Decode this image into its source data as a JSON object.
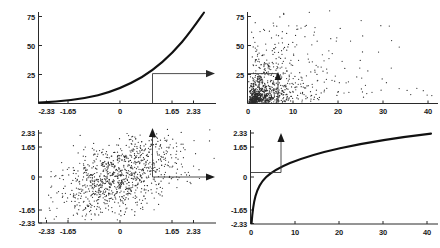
{
  "figure": {
    "title": "",
    "background_color": "#ffffff",
    "ink_color": "#111111",
    "panel_count": 4
  },
  "chart_data": [
    {
      "id": "top-left",
      "type": "line",
      "title": "",
      "xlabel": "",
      "ylabel": "",
      "xlim": [
        -2.8,
        2.8
      ],
      "ylim": [
        0,
        85
      ],
      "grid": false,
      "legend": null,
      "xticks": [
        -2.33,
        -1.65,
        0,
        1.65,
        2.33
      ],
      "xtick_labels": [
        "-2.33",
        "-1.65",
        "0",
        "1.65",
        "2.33"
      ],
      "yticks": [
        25,
        50,
        75
      ],
      "ytick_labels": [
        "25",
        "50",
        "75"
      ],
      "series": [
        {
          "name": "exponential-transform",
          "x": [
            -2.8,
            -2.33,
            -2.0,
            -1.65,
            -1.2,
            -0.8,
            -0.4,
            0.0,
            0.4,
            0.8,
            1.0,
            1.2,
            1.4,
            1.65,
            1.9,
            2.1,
            2.33,
            2.6
          ],
          "y": [
            0.4,
            0.7,
            1.1,
            1.7,
            3.0,
            4.7,
            7.0,
            10.0,
            14.0,
            19.2,
            22.5,
            26.5,
            31.0,
            37.5,
            45.0,
            52.5,
            62.0,
            76.0
          ]
        }
      ],
      "annotations": [
        {
          "type": "vertical-guide",
          "x": 0.66,
          "y_from": 0,
          "y_to": 29.5
        },
        {
          "type": "horizontal-arrow",
          "y": 29.5,
          "x_from": 0.66,
          "x_to": 2.85,
          "direction": "right"
        }
      ]
    },
    {
      "id": "top-right",
      "type": "scatter",
      "title": "",
      "xlabel": "",
      "ylabel": "",
      "xlim": [
        0,
        43
      ],
      "ylim": [
        0,
        85
      ],
      "grid": false,
      "legend": null,
      "xticks": [
        0,
        10,
        20,
        30,
        40
      ],
      "xtick_labels": [
        "0",
        "10",
        "20",
        "30",
        "40"
      ],
      "yticks": [
        25,
        50,
        75
      ],
      "ytick_labels": [
        "25",
        "50",
        "75"
      ],
      "point_count": 1000,
      "marker": "dot",
      "distribution": "bivariate-lognormal",
      "annotations": [
        {
          "type": "horizontal-guide",
          "y": 29.5,
          "x_from": 0,
          "x_to": 8.0
        },
        {
          "type": "vertical-arrow",
          "x": 8.0,
          "y_from": 0,
          "y_to": 29.5,
          "direction": "up"
        }
      ]
    },
    {
      "id": "bottom-left",
      "type": "scatter",
      "title": "",
      "xlabel": "",
      "ylabel": "",
      "xlim": [
        -2.8,
        2.8
      ],
      "ylim": [
        -2.8,
        2.8
      ],
      "grid": false,
      "legend": null,
      "xticks": [
        -2.33,
        -1.65,
        0,
        1.65,
        2.33
      ],
      "xtick_labels": [
        "-2.33",
        "-1.65",
        "0",
        "1.65",
        "2.33"
      ],
      "yticks": [
        -2.33,
        -1.65,
        0,
        1.65,
        2.33
      ],
      "ytick_labels": [
        "-2.33",
        "-1.65",
        "0",
        "1.65",
        "2.33"
      ],
      "point_count": 1000,
      "marker": "dot",
      "distribution": "bivariate-normal",
      "annotations": [
        {
          "type": "vertical-arrow",
          "x": 0.66,
          "y_from": 0,
          "y_to": 2.6,
          "direction": "up"
        },
        {
          "type": "horizontal-arrow",
          "y": 0,
          "x_from": 0.66,
          "x_to": 2.85,
          "direction": "right"
        }
      ]
    },
    {
      "id": "bottom-right",
      "type": "line",
      "title": "",
      "xlabel": "",
      "ylabel": "",
      "xlim": [
        0,
        43
      ],
      "ylim": [
        -2.8,
        2.8
      ],
      "grid": false,
      "legend": null,
      "xticks": [
        0,
        10,
        20,
        30,
        40
      ],
      "xtick_labels": [
        "0",
        "10",
        "20",
        "30",
        "40"
      ],
      "yticks": [
        -2.33,
        -1.65,
        0,
        1.65,
        2.33
      ],
      "ytick_labels": [
        "-2.33",
        "-1.65",
        "0",
        "1.65",
        "2.33"
      ],
      "series": [
        {
          "name": "log-transform",
          "x": [
            0.05,
            0.3,
            0.7,
            1.2,
            2.0,
            3.0,
            4.5,
            6.0,
            8.0,
            10.0,
            13.0,
            16.0,
            20.0,
            25.0,
            30.0,
            35.0,
            40.0,
            42.0
          ],
          "y": [
            -2.75,
            -1.95,
            -1.35,
            -0.9,
            -0.4,
            -0.05,
            0.38,
            0.68,
            1.0,
            1.22,
            1.48,
            1.68,
            1.9,
            2.12,
            2.3,
            2.44,
            2.55,
            2.6
          ]
        }
      ],
      "annotations": [
        {
          "type": "horizontal-guide",
          "y": 0.3,
          "x_from": 0,
          "x_to": 8.0
        },
        {
          "type": "vertical-arrow",
          "x": 8.0,
          "y_from": 0.3,
          "y_to": 2.75,
          "direction": "up"
        }
      ]
    }
  ],
  "labels": {
    "tl": {
      "y": [
        "75",
        "50",
        "25"
      ],
      "x": [
        "-2.33",
        "-1.65",
        "0",
        "1.65",
        "2.33"
      ]
    },
    "tr": {
      "y": [
        "75",
        "50",
        "25"
      ],
      "x": [
        "0",
        "10",
        "20",
        "30",
        "40"
      ]
    },
    "bl": {
      "y": [
        "2.33",
        "1.65",
        "0",
        "-1.65",
        "-2.33"
      ],
      "x": [
        "-2.33",
        "-1.65",
        "0",
        "1.65",
        "2.33"
      ]
    },
    "br": {
      "y": [
        "2.33",
        "1.65",
        "0",
        "-1.65",
        "-2.33"
      ],
      "x": [
        "0",
        "10",
        "20",
        "30",
        "40"
      ]
    }
  }
}
